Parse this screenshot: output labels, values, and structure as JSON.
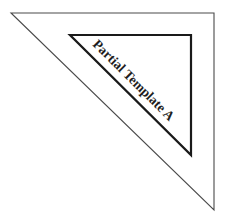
{
  "diagram": {
    "label": "Partial Template A",
    "colors": {
      "outer_stroke": "#4a4a4a",
      "inner_stroke": "#1a1a1a",
      "text": "#1e1e1e",
      "background": "#ffffff"
    },
    "outer_triangle": [
      [
        11,
        13
      ],
      [
        214,
        13
      ],
      [
        214,
        210
      ]
    ],
    "inner_triangle": [
      [
        70,
        35
      ],
      [
        191,
        35
      ],
      [
        191,
        155
      ]
    ]
  }
}
